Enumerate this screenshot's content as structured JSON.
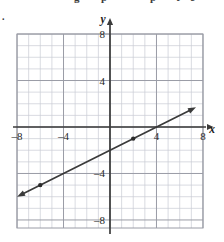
{
  "page": {
    "header_fragments": [
      {
        "text": "g",
        "x": 74
      },
      {
        "text": "p",
        "x": 101
      },
      {
        "text": "p",
        "x": 150
      },
      {
        "text": "t",
        "x": 176
      },
      {
        "text": "e",
        "x": 190
      }
    ],
    "item_number": "."
  },
  "colors": {
    "grid_minor": "#c9cbd4",
    "grid_major": "#9a9ca6",
    "axis": "#3b3b3b",
    "line": "#3a3a3a",
    "point": "#2b2b2b",
    "background": "#ffffff",
    "text": "#262626"
  },
  "axes": {
    "x_label": "x",
    "y_label": "y",
    "x_ticks": [
      {
        "value": -8,
        "label": "–8"
      },
      {
        "value": -4,
        "label": "–4"
      },
      {
        "value": 4,
        "label": "4"
      },
      {
        "value": 8,
        "label": "8"
      }
    ],
    "y_ticks": [
      {
        "value": 8,
        "label": "8"
      },
      {
        "value": 4,
        "label": "4"
      },
      {
        "value": -4,
        "label": "–4"
      },
      {
        "value": -8,
        "label": "–8"
      }
    ]
  },
  "chart_data": {
    "type": "line",
    "title": "",
    "xlabel": "x",
    "ylabel": "y",
    "xlim": [
      -8,
      8
    ],
    "ylim": [
      -8,
      8
    ],
    "grid": true,
    "grid_minor_step": 1,
    "grid_major_step": 4,
    "legend": "none",
    "series": [
      {
        "name": "line",
        "equation": "y = 0.5x - 2",
        "slope": 0.5,
        "intercept": -2,
        "x_intercept": 4,
        "arrows": "both",
        "x": [
          -8.0,
          7.4
        ],
        "y": [
          -6.0,
          1.7
        ]
      }
    ],
    "points": [
      {
        "x": -6,
        "y": -5,
        "label": ""
      },
      {
        "x": 2,
        "y": -1,
        "label": ""
      }
    ],
    "annotations": []
  }
}
